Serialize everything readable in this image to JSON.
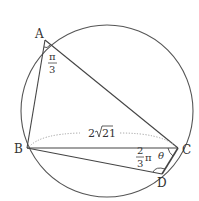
{
  "diagram": {
    "type": "geometry",
    "points": {
      "A": {
        "label": "A"
      },
      "B": {
        "label": "B"
      },
      "C": {
        "label": "C"
      },
      "D": {
        "label": "D"
      }
    },
    "annotations": {
      "angle_A_num": "π",
      "angle_A_den": "3",
      "side_BC": "2√21",
      "side_BC_prefix": "2",
      "side_BC_radicand": "21",
      "angle_D_num": "2",
      "angle_D_den": "3",
      "angle_D_pi": "π",
      "angle_C": "θ"
    },
    "colors": {
      "stroke": "#444444",
      "text": "#333333",
      "dotted": "#999999"
    }
  }
}
